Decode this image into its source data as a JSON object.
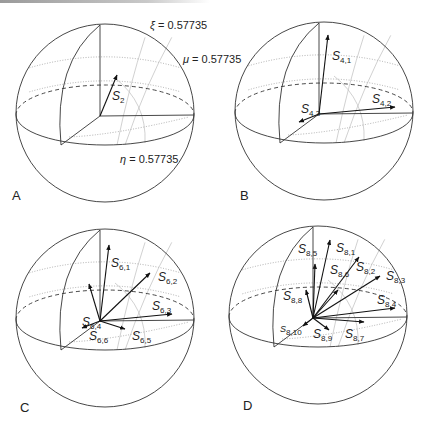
{
  "figure": {
    "panels": [
      {
        "id": "A",
        "label": "A",
        "center": [
          105,
          113
        ],
        "radius": 89,
        "annotations": [
          {
            "symbol": "ξ",
            "text": " = 0.57735",
            "x": 150,
            "y": 29
          },
          {
            "symbol": "μ",
            "text": " = 0.57735",
            "x": 183,
            "y": 63
          },
          {
            "symbol": "η",
            "text": " = 0.57735",
            "x": 120,
            "y": 163
          }
        ],
        "vectors": [
          {
            "name": "S",
            "sub": "2",
            "to": [
              117,
              75
            ],
            "lx": 112,
            "ly": 100
          }
        ]
      },
      {
        "id": "B",
        "label": "B",
        "center": [
          324,
          111
        ],
        "radius": 89,
        "annotations": [],
        "vectors": [
          {
            "name": "S",
            "sub": "4,1",
            "to": [
              328,
              35
            ],
            "lx": 332,
            "ly": 60
          },
          {
            "name": "S",
            "sub": "4,2",
            "to": [
              395,
              107
            ],
            "lx": 372,
            "ly": 103
          },
          {
            "name": "S",
            "sub": "4,3",
            "to": [
              299,
              122
            ],
            "lx": 301,
            "ly": 113
          }
        ]
      },
      {
        "id": "C",
        "label": "C",
        "center": [
          105,
          318
        ],
        "radius": 89,
        "annotations": [],
        "vectors": [
          {
            "name": "S",
            "sub": "6,1",
            "to": [
              109,
              245
            ],
            "lx": 111,
            "ly": 267
          },
          {
            "name": "S",
            "sub": "6,2",
            "to": [
              150,
              273
            ],
            "lx": 158,
            "ly": 281
          },
          {
            "name": "S",
            "sub": "6,3",
            "to": [
              172,
              314
            ],
            "lx": 152,
            "ly": 310
          },
          {
            "name": "S",
            "sub": "6,4",
            "to": [
              89,
              284
            ],
            "lx": 82,
            "ly": 326
          },
          {
            "name": "S",
            "sub": "6,5",
            "to": [
              125,
              329
            ],
            "lx": 132,
            "ly": 340
          },
          {
            "name": "S",
            "sub": "6,6",
            "to": [
              82,
              328
            ],
            "lx": 89,
            "ly": 340
          }
        ]
      },
      {
        "id": "D",
        "label": "D",
        "center": [
          318,
          315
        ],
        "radius": 89,
        "annotations": [],
        "vectors": [
          {
            "name": "S",
            "sub": "8,1",
            "to": [
              330,
              240
            ],
            "lx": 336,
            "ly": 252
          },
          {
            "name": "S",
            "sub": "8,2",
            "to": [
              359,
              257
            ],
            "lx": 356,
            "ly": 271
          },
          {
            "name": "S",
            "sub": "8,3",
            "to": [
              380,
              276
            ],
            "lx": 386,
            "ly": 280
          },
          {
            "name": "S",
            "sub": "8,4",
            "to": [
              395,
              308
            ],
            "lx": 377,
            "ly": 304
          },
          {
            "name": "S",
            "sub": "8,5",
            "to": [
              315,
              264
            ],
            "lx": 298,
            "ly": 253
          },
          {
            "name": "S",
            "sub": "8,6",
            "to": [
              338,
              290
            ],
            "lx": 330,
            "ly": 274
          },
          {
            "name": "S",
            "sub": "8,7",
            "to": [
              364,
              322
            ],
            "lx": 345,
            "ly": 338
          },
          {
            "name": "S",
            "sub": "8,8",
            "to": [
              306,
              290
            ],
            "lx": 283,
            "ly": 300
          },
          {
            "name": "S",
            "sub": "8,9",
            "to": [
              329,
              330
            ],
            "lx": 313,
            "ly": 338
          },
          {
            "name": "S",
            "sub": "8,10",
            "to": [
              303,
              326
            ],
            "lx": 280,
            "ly": 332
          }
        ]
      }
    ]
  }
}
